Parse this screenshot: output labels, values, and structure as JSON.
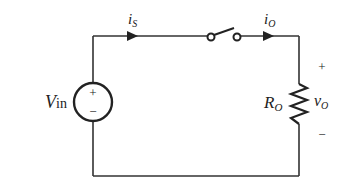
{
  "diagram": {
    "type": "circuit",
    "colors": {
      "wire": "#333333",
      "background": "#ffffff"
    },
    "components": {
      "source": {
        "label": "V",
        "label_sub": "in",
        "plus": "+",
        "minus": "−"
      },
      "switch": {
        "state": "open"
      },
      "resistor": {
        "label": "R",
        "label_sub": "O"
      }
    },
    "currents": {
      "source_current": {
        "label": "i",
        "label_sub": "S"
      },
      "output_current": {
        "label": "i",
        "label_sub": "O"
      }
    },
    "output_voltage": {
      "label": "v",
      "label_sub": "O",
      "plus": "+",
      "minus": "−"
    }
  }
}
